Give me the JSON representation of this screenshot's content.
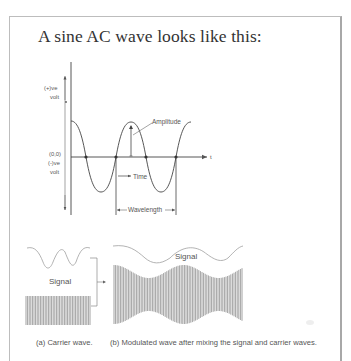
{
  "heading": "A sine AC wave looks like this:",
  "sine_diagram": {
    "y_axis_positive_label_line1": "(+)ve",
    "y_axis_positive_label_line2": "volt",
    "y_axis_negative_label_line1": "(-)ve",
    "y_axis_negative_label_line2": "volt",
    "origin_label": "(0,0)",
    "x_axis_label": "t",
    "amplitude_label": "Amplitude",
    "time_label": "Time",
    "wavelength_label": "Wavelength"
  },
  "modulation_diagram": {
    "signal_label_left": "Signal",
    "signal_label_right": "Signal",
    "caption_a": "(a) Carrier wave.",
    "caption_b": "(b) Modulated wave after mixing the signal and carrier waves."
  },
  "colors": {
    "line": "#555555",
    "text": "#333333",
    "signal_curve": "#9a9a9a",
    "carrier_fill": "#8a8a8a",
    "frame": "#bdbdbd"
  }
}
